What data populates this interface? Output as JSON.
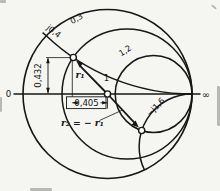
{
  "figure": {
    "axis": {
      "left_label": "0",
      "right_label": "∞"
    },
    "curve_labels": {
      "reactance_pos": "j0,4",
      "resistance_small": "0,3",
      "resistance_large": "1,2",
      "reactance_neg": "−j1,6"
    },
    "dimensions": {
      "vertical": "0,432",
      "horizontal": "0,405"
    },
    "points": {
      "center_label": "1",
      "vector_label": "r₁",
      "relation_label": "r₂ = − r₁"
    },
    "colors": {
      "stroke": "#161616",
      "background": "#f5f5f2",
      "point_fill": "#ffffff"
    }
  }
}
